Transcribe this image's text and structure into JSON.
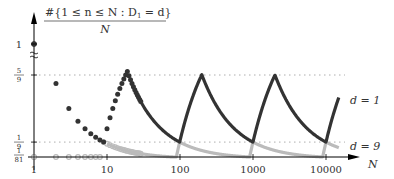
{
  "chart_data": {
    "type": "scatter",
    "title_numerator": "#{1 ≤ n ≤ N : D",
    "title_sub": "1",
    "title_numerator_tail": " = d}",
    "title_denominator": "N",
    "xlabel": "N",
    "ylabel": "#{1 ≤ n ≤ N : D₁ = d} / N",
    "x_scale": "log",
    "xlim": [
      1,
      15000
    ],
    "x_ticks": [
      {
        "value": 1,
        "label": "1"
      },
      {
        "value": 10,
        "label": "10"
      },
      {
        "value": 100,
        "label": "100"
      },
      {
        "value": 1000,
        "label": "1000"
      },
      {
        "value": 10000,
        "label": "10000"
      }
    ],
    "y_ticks": [
      {
        "value": 0.012345679,
        "label_num": "1",
        "label_den": "81"
      },
      {
        "value": 0.111111111,
        "label_num": "1",
        "label_den": "9"
      },
      {
        "value": 0.555555556,
        "label_num": "5",
        "label_den": "9"
      },
      {
        "value": 1,
        "label": "1"
      }
    ],
    "y_axis_break": true,
    "grid": "dotted horizontal lines at 1/9 and 5/9",
    "series": [
      {
        "name": "d = 1",
        "label": "d = 1",
        "color": "#333333",
        "description": "Fraction of n ≤ N with leading digit 1; sawtooth peaking at 5/9 at N = 2·10^k−1 and falling to 1/9 at N = 10^k−1"
      },
      {
        "name": "d = 9",
        "label": "d = 9",
        "color": "#bbbbbb",
        "description": "Fraction of n ≤ N with leading digit 9; zero until N=9, rises to 1/9 at N = 10^k−1, then decays toward 1/81"
      }
    ],
    "legend_position": "inline at right end of curves"
  },
  "labels": {
    "d1": "d = 1",
    "d9": "d = 9",
    "n_axis": "N"
  }
}
